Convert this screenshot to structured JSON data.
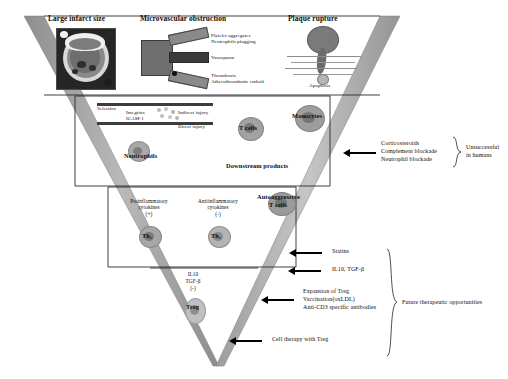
{
  "figure": {
    "type": "inverted-pyramid-funnel-diagram",
    "background": "#ffffff",
    "funnel_fill": "#ffffff",
    "funnel_edge": "#9a9a9a",
    "outline": "#2b2b2b"
  },
  "tier1": {
    "panels": [
      {
        "title": "Large infarct size",
        "figure": "cardiac-mri-short-axis"
      },
      {
        "title": "Microvascular obstruction",
        "figure": "vessel-branching-schematic",
        "annotations": [
          "Platelet aggregates",
          "Neutrophils plugging",
          "Vasospasm",
          "Thrombosis",
          "Atherothrombotic emboli"
        ]
      },
      {
        "title": "Plaque rupture",
        "figure": "plaque-rupture-schematic",
        "annotations": [
          "Apoptosis"
        ]
      }
    ]
  },
  "tier2": {
    "endothelium": {
      "labels": [
        "Selectins",
        "Integrins",
        "ICAM-1",
        "Indirect injury",
        "Direct injury"
      ]
    },
    "cells": [
      {
        "name": "Neutrophils"
      },
      {
        "name": "T cells"
      },
      {
        "name": "Monocytes"
      }
    ],
    "caption": "Downstream products",
    "therapy": {
      "items": [
        "Corticosteroids",
        "Complement blockade",
        "Neutrophil blockade"
      ],
      "bracket_label_line1": "Unsuccessful",
      "bracket_label_line2": "in humans"
    }
  },
  "tier3": {
    "columns": [
      {
        "title_line1": "Proinflammatory",
        "title_line2": "cytokines",
        "sign": "(+)",
        "cell": "Th₁"
      },
      {
        "title_line1": "Antiinflammatory",
        "title_line2": "cytokines",
        "sign": "(-)",
        "cell": "Th₂"
      }
    ],
    "autoaggressive": {
      "line1": "Autoaggressive",
      "line2": "T cells"
    },
    "therapy": {
      "statins": "Statins"
    }
  },
  "tier4": {
    "mediators": {
      "line1": "IL10",
      "line2": "TGF-β",
      "sign": "(-)"
    },
    "cell": "Treg",
    "therapy": {
      "cytokines": "IL10, TGF-β",
      "treg_block": [
        "Expansion of Treg",
        "Vaccination(oxLDL)",
        "Anti-CD3 specific antibodies"
      ],
      "cell_therapy": "Cell therapy with Treg",
      "bracket_label": "Future therapeutic opportunities"
    }
  }
}
